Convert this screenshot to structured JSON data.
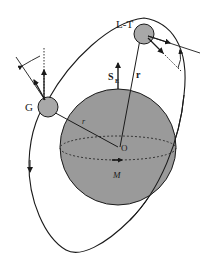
{
  "figure": {
    "type": "orbital geometry diagram",
    "labels": {
      "lt_satellite": "L-T",
      "g_satellite": "G",
      "spin_vector": "S",
      "spin_subscript": "E",
      "position_vector": "r",
      "radius": "r",
      "center": "O",
      "mass": "M"
    },
    "colors": {
      "sphere_fill": "#9a9a9a",
      "satellite_fill": "#a8a8a8",
      "stroke": "#1a1a1a",
      "background": "#ffffff"
    },
    "elements": [
      "central-sphere",
      "equator-ellipse-dashed",
      "orbit-ellipse",
      "satellite-LT",
      "satellite-G",
      "spin-vector-SE",
      "position-vector-r",
      "radius-line-r",
      "gyro-vectors-G",
      "gyro-vectors-LT"
    ]
  }
}
